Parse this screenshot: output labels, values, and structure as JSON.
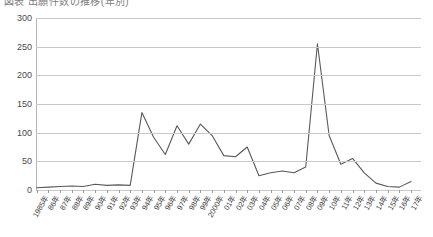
{
  "title": {
    "text": "図表  出願件数の推移(年別)",
    "note": "clipped at top edge"
  },
  "chart_data": {
    "type": "line",
    "title": "",
    "xlabel": "",
    "ylabel": "",
    "ylim": [
      0,
      300
    ],
    "ytick_step": 50,
    "grid": true,
    "legend": false,
    "legend_position": "none",
    "line_color": "#595959",
    "categories": [
      "1985年",
      "86年",
      "87年",
      "88年",
      "89年",
      "90年",
      "91年",
      "92年",
      "93年",
      "94年",
      "95年",
      "96年",
      "97年",
      "98年",
      "99年",
      "2000年",
      "01年",
      "02年",
      "03年",
      "04年",
      "05年",
      "06年",
      "07年",
      "08年",
      "09年",
      "10年",
      "11年",
      "12年",
      "13年",
      "14年",
      "15年",
      "16年",
      "17年"
    ],
    "yticks": [
      0,
      50,
      100,
      150,
      200,
      250,
      300
    ],
    "series": [
      {
        "name": "件数",
        "values": [
          4,
          5,
          6,
          7,
          6,
          10,
          8,
          9,
          8,
          135,
          92,
          62,
          112,
          80,
          115,
          95,
          60,
          58,
          75,
          25,
          30,
          33,
          30,
          40,
          255,
          95,
          45,
          55,
          30,
          12,
          6,
          5,
          15
        ]
      }
    ]
  }
}
